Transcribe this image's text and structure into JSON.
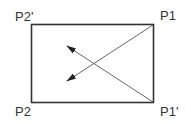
{
  "diagram": {
    "type": "rectangle-with-diagonal-arrows",
    "colors": {
      "background": "#ffffff",
      "stroke": "#333333",
      "diagonal": "#555555",
      "text": "#333333"
    },
    "rectangle": {
      "x": 31,
      "y": 24,
      "width": 123,
      "height": 79
    },
    "labels": {
      "top_left": "P2'",
      "top_right": "P1",
      "bottom_left": "P2",
      "bottom_right": "P1'"
    },
    "arrows": [
      {
        "name": "arrow-from-P1",
        "from": "P1",
        "x1": 154,
        "y1": 24,
        "x2": 67,
        "y2": 81
      },
      {
        "name": "arrow-from-P1-prime",
        "from": "P1'",
        "x1": 154,
        "y1": 103,
        "x2": 67,
        "y2": 46
      }
    ]
  }
}
